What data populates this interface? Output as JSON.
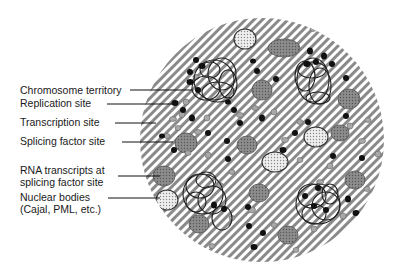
{
  "diagram": {
    "labels": [
      {
        "id": "chromosome-territory",
        "text": "Chromosome territory",
        "x": 20,
        "y": 84
      },
      {
        "id": "replication-site",
        "text": "Replication site",
        "x": 20,
        "y": 97
      },
      {
        "id": "transcription-site",
        "text": "Transcription site",
        "x": 20,
        "y": 116
      },
      {
        "id": "splicing-factor-site",
        "text": "Splicing factor site",
        "x": 20,
        "y": 135
      },
      {
        "id": "rna-transcripts",
        "text": "RNA transcripts at",
        "x": 20,
        "y": 164
      },
      {
        "id": "rna-transcripts-2",
        "text": "splicing factor site",
        "x": 20,
        "y": 176
      },
      {
        "id": "nuclear-bodies",
        "text": "Nuclear bodies",
        "x": 20,
        "y": 191
      },
      {
        "id": "nuclear-bodies-2",
        "text": "(Cajal, PML, etc.)",
        "x": 20,
        "y": 203
      }
    ],
    "colors": {
      "hatch_dark": "#8a8a8a",
      "hatch_light": "#ffffff",
      "replication": "#111111",
      "transcription": "#a8a8a8",
      "splicing": "#7a7a7a",
      "nuclear_body": "#e6e6e6",
      "outline": "#333333"
    }
  }
}
